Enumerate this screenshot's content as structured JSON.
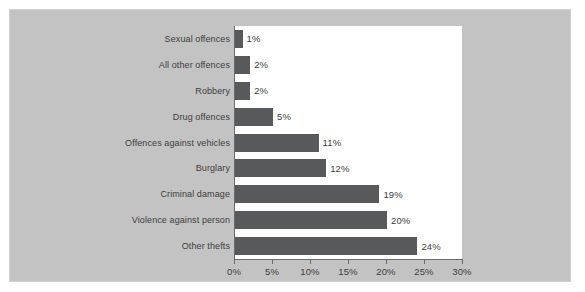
{
  "chart_data": {
    "type": "bar",
    "orientation": "horizontal",
    "title": "",
    "subtitle": "",
    "xlabel": "",
    "ylabel": "",
    "categories": [
      "Sexual offences",
      "All other offences",
      "Robbery",
      "Drug offences",
      "Offences against vehicles",
      "Burglary",
      "Criminal damage",
      "Violence against person",
      "Other thefts"
    ],
    "values": [
      1,
      2,
      2,
      5,
      11,
      12,
      19,
      20,
      24
    ],
    "value_labels": [
      "1%",
      "2%",
      "2%",
      "5%",
      "11%",
      "12%",
      "19%",
      "20%",
      "24%"
    ],
    "xlim": [
      0,
      30
    ],
    "xticks": [
      0,
      5,
      10,
      15,
      20,
      25,
      30
    ],
    "xtick_labels": [
      "0%",
      "5%",
      "10%",
      "15%",
      "20%",
      "25%",
      "30%"
    ],
    "grid": false,
    "legend": null,
    "legend_position": "none",
    "colors": {
      "bar": "#58595b",
      "panel_background": "#c3c3c3",
      "plot_background": "#ffffff",
      "axis": "#6b6b6b",
      "text": "#3d3d3d"
    }
  }
}
